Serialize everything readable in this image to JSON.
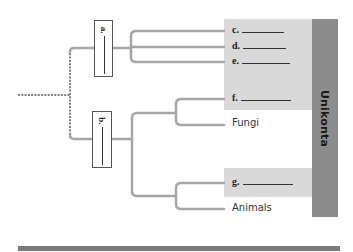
{
  "diagram": {
    "type": "phylogenetic-tree",
    "clade_label": "Unikonta",
    "question_nodes": [
      {
        "id": "a",
        "label": "a."
      },
      {
        "id": "b",
        "label": "b."
      }
    ],
    "tips": [
      {
        "id": "c",
        "label": "c.",
        "blank": true,
        "shaded": true
      },
      {
        "id": "d",
        "label": "d.",
        "blank": true,
        "shaded": true
      },
      {
        "id": "e",
        "label": "e.",
        "blank": true,
        "shaded": true
      },
      {
        "id": "f",
        "label": "f.",
        "blank": true,
        "shaded": true
      },
      {
        "id": "fungi",
        "label": "Fungi",
        "blank": false,
        "shaded": false
      },
      {
        "id": "g",
        "label": "g.",
        "blank": true,
        "shaded": true
      },
      {
        "id": "animals",
        "label": "Animals",
        "blank": false,
        "shaded": false
      }
    ],
    "colors": {
      "branch": "#a6a6a6",
      "dotted_root": "#7f7f7f",
      "shade": "#d9d9d9",
      "clade_bar": "#8c8c8c",
      "bottom_rule": "#7a7a7a"
    }
  }
}
